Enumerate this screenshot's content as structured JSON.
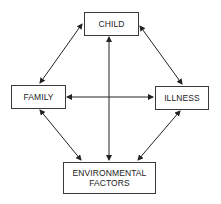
{
  "diagram": {
    "type": "relationship-diagram",
    "nodes": {
      "child": {
        "label": "CHILD"
      },
      "family": {
        "label": "FAMILY"
      },
      "illness": {
        "label": "ILLNESS"
      },
      "environmental": {
        "line1": "ENVIRONMENTAL",
        "line2": "FACTORS"
      }
    },
    "edges": [
      {
        "from": "CHILD",
        "to": "FAMILY",
        "direction": "bidirectional"
      },
      {
        "from": "CHILD",
        "to": "ILLNESS",
        "direction": "bidirectional"
      },
      {
        "from": "CHILD",
        "to": "ENVIRONMENTAL FACTORS",
        "direction": "bidirectional"
      },
      {
        "from": "FAMILY",
        "to": "ILLNESS",
        "direction": "bidirectional"
      },
      {
        "from": "FAMILY",
        "to": "ENVIRONMENTAL FACTORS",
        "direction": "bidirectional"
      },
      {
        "from": "ILLNESS",
        "to": "ENVIRONMENTAL FACTORS",
        "direction": "bidirectional"
      }
    ],
    "colors": {
      "line": "#222222",
      "box_border": "#3a3a3a",
      "background": "#ffffff"
    }
  }
}
